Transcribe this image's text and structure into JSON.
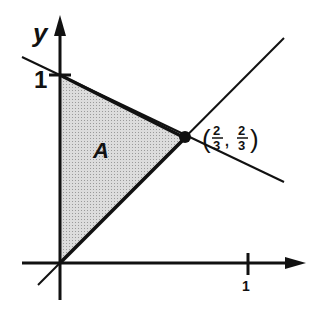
{
  "diagram": {
    "axes": {
      "x_label": "",
      "y_label": "y",
      "x_tick_label": "1",
      "y_tick_label": "1"
    },
    "region": {
      "label": "A",
      "fill": "#cfcfcf",
      "vertices": [
        [
          0,
          0
        ],
        [
          0,
          1
        ],
        [
          0.6667,
          0.6667
        ]
      ]
    },
    "lines": [
      {
        "name": "y = x",
        "through": [
          [
            0,
            0
          ],
          [
            1,
            1
          ]
        ]
      },
      {
        "name": "x + 2y = 2",
        "through": [
          [
            0,
            1
          ],
          [
            0.6667,
            0.6667
          ]
        ]
      }
    ],
    "point": {
      "label_num_x": "2",
      "label_den_x": "3",
      "label_num_y": "2",
      "label_den_y": "3",
      "open_paren": "(",
      "comma": ",",
      "close_paren": ")"
    }
  }
}
